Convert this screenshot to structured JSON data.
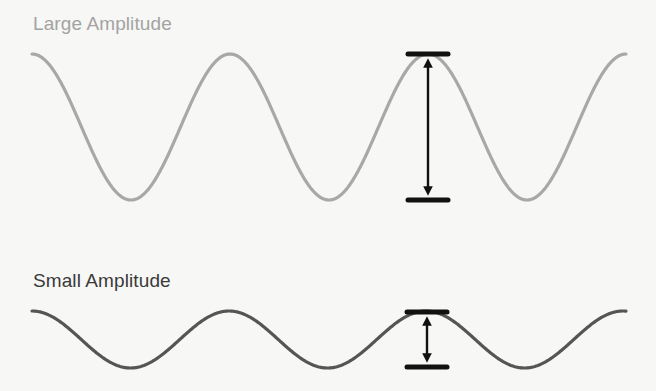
{
  "labels": {
    "large": "Large Amplitude",
    "small": "Small Amplitude"
  },
  "waves": [
    {
      "name": "large",
      "color": "#a8a8a8",
      "peak_y": 54,
      "trough_y": 200,
      "x_start": 32,
      "x_end": 626,
      "period": 198
    },
    {
      "name": "small",
      "color": "#555555",
      "peak_y": 311,
      "trough_y": 368,
      "x_start": 32,
      "x_end": 626,
      "period": 197
    }
  ],
  "markers": [
    {
      "wave": "large",
      "x": 428,
      "top": 54,
      "bottom": 200
    },
    {
      "wave": "small",
      "x": 427,
      "top": 312,
      "bottom": 367
    }
  ],
  "colors": {
    "background": "#f7f7f5",
    "marker": "#111111"
  }
}
